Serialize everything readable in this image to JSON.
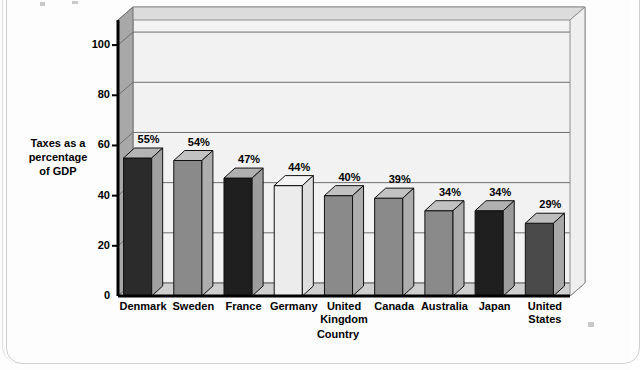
{
  "chart_data": {
    "type": "bar",
    "title": "",
    "subtitle": "",
    "xlabel": "Country",
    "ylabel": "Taxes as a percentage of GDP",
    "categories": [
      "Denmark",
      "Sweden",
      "France",
      "Germany",
      "United Kingdom",
      "Canada",
      "Australia",
      "Japan",
      "United States"
    ],
    "values": [
      55,
      54,
      47,
      44,
      40,
      39,
      34,
      34,
      29
    ],
    "data_labels": [
      "55%",
      "54%",
      "47%",
      "44%",
      "40%",
      "39%",
      "34%",
      "34%",
      "29%"
    ],
    "yticks": [
      0,
      20,
      40,
      60,
      80,
      100
    ],
    "ytick_labels": [
      "0",
      "20",
      "40",
      "60",
      "80",
      "100"
    ],
    "ylim": [
      0,
      110
    ],
    "grid": true,
    "legend": "none",
    "style": "3d-bar",
    "bar_colors": [
      "#2b2b2b",
      "#8a8a8a",
      "#1f1f1f",
      "#ececec",
      "#8a8a8a",
      "#8a8a8a",
      "#8a8a8a",
      "#1f1f1f",
      "#4a4a4a"
    ],
    "bar_top_colors": [
      "#b4b4b4",
      "#c2c2c2",
      "#b0b0b0",
      "#f4f4f4",
      "#c2c2c2",
      "#c2c2c2",
      "#c2c2c2",
      "#b0b0b0",
      "#bdbdbd"
    ],
    "bar_side_colors": [
      "#a0a0a0",
      "#adadad",
      "#9c9c9c",
      "#dedede",
      "#adadad",
      "#adadad",
      "#adadad",
      "#9c9c9c",
      "#a8a8a8"
    ]
  },
  "ytitle_lines": [
    "Taxes as a",
    "percentage",
    "of GDP"
  ],
  "xcat_lines": [
    [
      "Denmark"
    ],
    [
      "Sweden"
    ],
    [
      "France"
    ],
    [
      "Germany"
    ],
    [
      "United",
      "Kingdom"
    ],
    [
      "Canada"
    ],
    [
      "Australia"
    ],
    [
      "Japan"
    ],
    [
      "United",
      "States"
    ]
  ],
  "colors": {
    "plot_back": "#f2f2f2",
    "plot_top": "#dcdcdc",
    "plot_side": "#a8a8a8",
    "grid": "#6e6e6e",
    "axis": "#000000",
    "page": "#fdfdfd"
  }
}
